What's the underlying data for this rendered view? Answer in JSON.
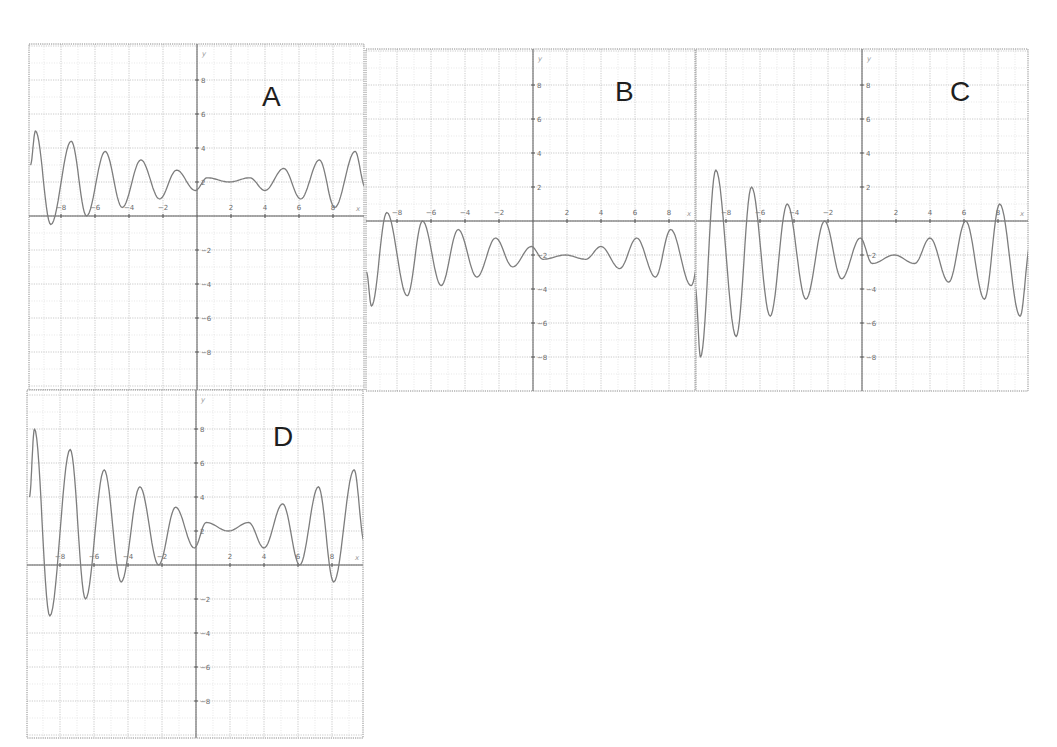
{
  "chart_data": [
    {
      "type": "line",
      "title": "A",
      "xlabel": "x",
      "ylabel": "y",
      "xlim": [
        -9.9,
        9.9
      ],
      "ylim": [
        -10,
        10
      ],
      "grid": true,
      "x_ticks": [
        -8,
        -6,
        -4,
        -2,
        2,
        4,
        6,
        8
      ],
      "y_ticks": [
        8,
        6,
        4,
        2,
        -2,
        -4,
        -6,
        -8
      ],
      "series": [
        {
          "name": "A",
          "points": [
            [
              -9.8,
              3.0
            ],
            [
              -9.5,
              5.0
            ],
            [
              -8.6,
              -0.5
            ],
            [
              -7.4,
              4.4
            ],
            [
              -6.5,
              0.0
            ],
            [
              -5.4,
              3.8
            ],
            [
              -4.4,
              0.5
            ],
            [
              -3.3,
              3.3
            ],
            [
              -2.2,
              1.0
            ],
            [
              -1.2,
              2.7
            ],
            [
              -0.1,
              1.5
            ],
            [
              0.6,
              2.25
            ],
            [
              1.9,
              2.0
            ],
            [
              3.1,
              2.25
            ],
            [
              4.0,
              1.5
            ],
            [
              5.1,
              2.8
            ],
            [
              6.1,
              1.0
            ],
            [
              7.2,
              3.3
            ],
            [
              8.1,
              0.5
            ],
            [
              9.3,
              3.8
            ],
            [
              9.9,
              1.7
            ]
          ]
        }
      ]
    },
    {
      "type": "line",
      "title": "B",
      "xlabel": "x",
      "ylabel": "y",
      "xlim": [
        -9.9,
        9.5
      ],
      "ylim": [
        -10,
        10
      ],
      "grid": true,
      "x_ticks": [
        -8,
        -6,
        -4,
        -2,
        2,
        4,
        6,
        8
      ],
      "y_ticks": [
        8,
        6,
        4,
        2,
        -2,
        -4,
        -6,
        -8
      ],
      "series": [
        {
          "name": "B",
          "points": [
            [
              -9.8,
              -3.0
            ],
            [
              -9.5,
              -5.0
            ],
            [
              -8.6,
              0.5
            ],
            [
              -7.4,
              -4.4
            ],
            [
              -6.5,
              0.0
            ],
            [
              -5.4,
              -3.8
            ],
            [
              -4.4,
              -0.5
            ],
            [
              -3.3,
              -3.3
            ],
            [
              -2.2,
              -1.0
            ],
            [
              -1.2,
              -2.7
            ],
            [
              -0.1,
              -1.5
            ],
            [
              0.6,
              -2.25
            ],
            [
              1.9,
              -2.0
            ],
            [
              3.1,
              -2.25
            ],
            [
              4.0,
              -1.5
            ],
            [
              5.1,
              -2.8
            ],
            [
              6.1,
              -1.0
            ],
            [
              7.2,
              -3.3
            ],
            [
              8.1,
              -0.5
            ],
            [
              9.3,
              -3.8
            ],
            [
              9.9,
              -1.7
            ]
          ]
        }
      ]
    },
    {
      "type": "line",
      "title": "C",
      "xlabel": "x",
      "ylabel": "y",
      "xlim": [
        -9.7,
        9.8
      ],
      "ylim": [
        -10,
        10
      ],
      "grid": true,
      "x_ticks": [
        -8,
        -6,
        -4,
        -2,
        2,
        4,
        6,
        8
      ],
      "y_ticks": [
        8,
        6,
        4,
        2,
        -2,
        -4,
        -6,
        -8
      ],
      "series": [
        {
          "name": "C",
          "points": [
            [
              -9.8,
              -4.0
            ],
            [
              -9.5,
              -8.0
            ],
            [
              -8.6,
              3.0
            ],
            [
              -7.4,
              -6.8
            ],
            [
              -6.5,
              2.0
            ],
            [
              -5.4,
              -5.6
            ],
            [
              -4.4,
              1.0
            ],
            [
              -3.3,
              -4.6
            ],
            [
              -2.2,
              0.0
            ],
            [
              -1.2,
              -3.4
            ],
            [
              -0.1,
              -1.0
            ],
            [
              0.6,
              -2.5
            ],
            [
              1.9,
              -2.0
            ],
            [
              3.1,
              -2.5
            ],
            [
              4.0,
              -1.0
            ],
            [
              5.1,
              -3.6
            ],
            [
              6.1,
              0.0
            ],
            [
              7.2,
              -4.6
            ],
            [
              8.1,
              1.0
            ],
            [
              9.3,
              -5.6
            ],
            [
              9.9,
              -1.4
            ]
          ]
        }
      ]
    },
    {
      "type": "line",
      "title": "D",
      "xlabel": "x",
      "ylabel": "y",
      "xlim": [
        -9.9,
        9.9
      ],
      "ylim": [
        -10,
        10
      ],
      "grid": true,
      "x_ticks": [
        -8,
        -6,
        -4,
        -2,
        2,
        4,
        6,
        8
      ],
      "y_ticks": [
        8,
        6,
        4,
        2,
        -2,
        -4,
        -6,
        -8
      ],
      "series": [
        {
          "name": "D",
          "points": [
            [
              -9.8,
              4.0
            ],
            [
              -9.5,
              8.0
            ],
            [
              -8.6,
              -3.0
            ],
            [
              -7.4,
              6.8
            ],
            [
              -6.5,
              -2.0
            ],
            [
              -5.4,
              5.6
            ],
            [
              -4.4,
              -1.0
            ],
            [
              -3.3,
              4.6
            ],
            [
              -2.2,
              0.0
            ],
            [
              -1.2,
              3.4
            ],
            [
              -0.1,
              1.0
            ],
            [
              0.6,
              2.5
            ],
            [
              1.9,
              2.0
            ],
            [
              3.1,
              2.5
            ],
            [
              4.0,
              1.0
            ],
            [
              5.1,
              3.6
            ],
            [
              6.1,
              0.0
            ],
            [
              7.2,
              4.6
            ],
            [
              8.1,
              -1.0
            ],
            [
              9.3,
              5.6
            ],
            [
              9.9,
              1.4
            ]
          ]
        }
      ]
    }
  ],
  "panels": [
    {
      "label": "A",
      "left": 29,
      "top": 44,
      "right": 364,
      "bottom": 390,
      "origin_x": 197,
      "origin_y": 216,
      "letter_x": 262,
      "letter_y": 106
    },
    {
      "label": "B",
      "left": 366,
      "top": 49,
      "right": 695,
      "bottom": 391,
      "origin_x": 533,
      "origin_y": 221,
      "letter_x": 615,
      "letter_y": 101
    },
    {
      "label": "C",
      "left": 696,
      "top": 49,
      "right": 1028,
      "bottom": 391,
      "origin_x": 862,
      "origin_y": 221,
      "letter_x": 950,
      "letter_y": 101
    },
    {
      "label": "D",
      "left": 27,
      "top": 390,
      "right": 363,
      "bottom": 738,
      "origin_x": 196,
      "origin_y": 565,
      "letter_x": 273,
      "letter_y": 446
    }
  ],
  "scale_px_per_unit": 17,
  "axis_names": {
    "x": "x",
    "y": "y"
  },
  "colors": {
    "curve": "#7d7d7d",
    "axis": "#5a5a5a",
    "grid": "#bdbdbd",
    "letter": "#1e1e1e"
  }
}
